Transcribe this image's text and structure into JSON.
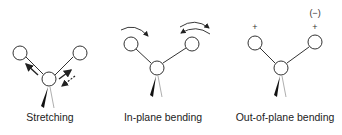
{
  "diagram": {
    "panels": [
      {
        "id": "stretching",
        "label": "Stretching",
        "atoms": {
          "left": [
            20,
            53
          ],
          "center": [
            49,
            79
          ],
          "right": [
            80,
            53
          ]
        },
        "arrows": [
          "solid arrow outward along left bond",
          "solid arrow outward along right bond",
          "dashed arrow inward along right bond"
        ]
      },
      {
        "id": "in-plane-bending",
        "label": "In-plane bending",
        "atoms": {
          "left": [
            131,
            44
          ],
          "center": [
            157,
            68
          ],
          "right": [
            192,
            44
          ]
        },
        "arrows": [
          "curved arrow over left atom (clockwise)",
          "curved arrow over right atom (counter-clockwise)",
          "second curved arc over right atom"
        ]
      },
      {
        "id": "out-of-plane-bending",
        "label": "Out-of-plane bending",
        "atoms": {
          "left": [
            255,
            43
          ],
          "center": [
            281,
            68
          ],
          "right": [
            315,
            42
          ]
        },
        "signs": {
          "left": "+",
          "right": "+",
          "right_alt": "(−)"
        }
      }
    ],
    "colors": {
      "stroke": "#333333",
      "text": "#222222",
      "background": "#ffffff"
    }
  }
}
